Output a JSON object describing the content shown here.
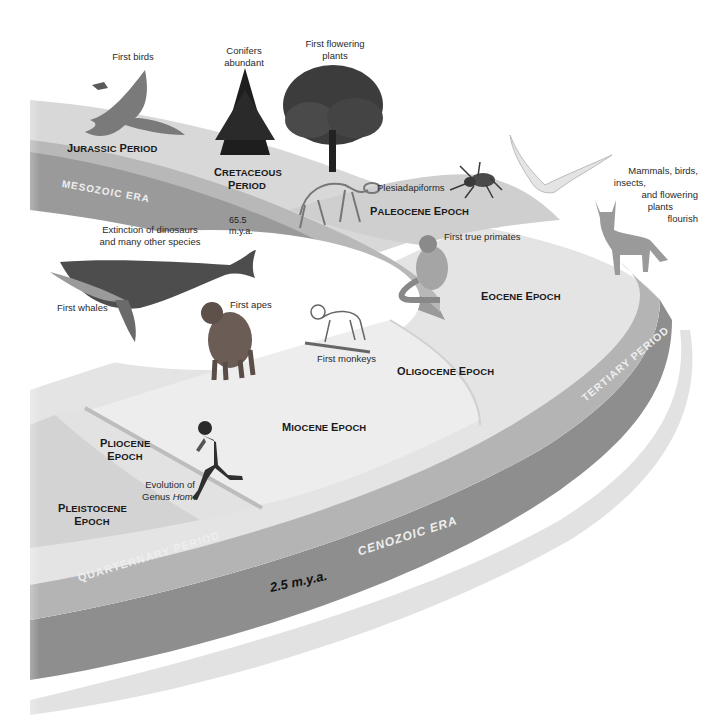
{
  "diagram": {
    "eras": [
      {
        "name": "Mesozoic Era",
        "label": "MESOZOIC ERA"
      },
      {
        "name": "Cenozoic Era",
        "label": "CENOZOIC ERA"
      }
    ],
    "periods": {
      "jurassic": {
        "first": "J",
        "rest": "URASSIC",
        "first2": "P",
        "rest2": "ERIOD"
      },
      "cretaceous": {
        "line1_first": "C",
        "line1_rest": "RETACEOUS",
        "line2_first": "P",
        "line2_rest": "ERIOD"
      },
      "tertiary": "TERTIARY PERIOD",
      "quaternary": "QUARTERNARY PERIOD"
    },
    "epochs": {
      "paleocene": {
        "a": "P",
        "b": "ALEOCENE ",
        "c": "E",
        "d": "POCH"
      },
      "eocene": {
        "a": "E",
        "b": "OCENE ",
        "c": "E",
        "d": "POCH"
      },
      "oligocene": {
        "a": "O",
        "b": "LIGOCENE ",
        "c": "E",
        "d": "POCH"
      },
      "miocene": {
        "a": "M",
        "b": "IOCENE ",
        "c": "E",
        "d": "POCH"
      },
      "pliocene": {
        "a": "P",
        "b": "LIOCENE",
        "c": "E",
        "d": "POCH"
      },
      "pleistocene": {
        "a": "P",
        "b": "LEISTOCENE",
        "c": "E",
        "d": "POCH"
      }
    },
    "time_markers": {
      "mya_65_5_line1": "65.5",
      "mya_65_5_line2": "m.y.a.",
      "mya_2_5": "2.5 m.y.a."
    },
    "annotations": {
      "first_birds": "First birds",
      "conifers_l1": "Conifers",
      "conifers_l2": "abundant",
      "flowering_l1": "First flowering",
      "flowering_l2": "plants",
      "plesiadapiforms": "Plesiadapiforms",
      "extinction_l1": "Extinction of  dinosaurs",
      "extinction_l2": "and  many other species",
      "first_whales": "First whales",
      "first_apes": "First apes",
      "first_true_primates": "First true primates",
      "first_monkeys": "First monkeys",
      "mammals_l1": "Mammals, birds,",
      "mammals_l2": "insects,",
      "mammals_l3": "and flowering",
      "mammals_l4": "plants",
      "mammals_l5": "flourish",
      "homo_l1": "Evolution of",
      "homo_l2a": "Genus ",
      "homo_l2b": "Homo"
    },
    "illustrations": [
      "archaeopteryx",
      "conifer-tree",
      "flowering-tree",
      "plesiadapiform-skeleton",
      "spider",
      "seagull",
      "coyote",
      "lemur",
      "whale",
      "chimpanzee",
      "monkey-skeleton",
      "running-human"
    ],
    "colors": {
      "band_top": "#c4c4c4",
      "band_side": "#8e8e8e",
      "surface_light": "#e6e6e6",
      "surface_mid": "#d6d6d6",
      "epoch_divider": "#bdbdbd"
    }
  }
}
